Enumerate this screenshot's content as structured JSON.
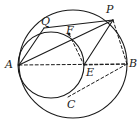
{
  "figure": {
    "stroke_color": "#1a1a1a",
    "background_color": "#ffffff",
    "solid_stroke_width": 1.1,
    "dashed_stroke_width": 1.0,
    "dash_pattern": "3,2.4"
  },
  "circles": [
    {
      "name": "outer-circle",
      "cx": 73,
      "cy": 64,
      "r": 54,
      "style": "solid"
    },
    {
      "name": "inner-circle",
      "cx": 51,
      "cy": 65,
      "r": 33,
      "style": "solid"
    }
  ],
  "points": [
    {
      "id": "A",
      "label": "A",
      "x": 19,
      "y": 65,
      "label_x": 5,
      "label_y": 59
    },
    {
      "id": "B",
      "label": "B",
      "x": 127,
      "y": 64,
      "label_x": 129,
      "label_y": 58
    },
    {
      "id": "C",
      "label": "C",
      "x": 68,
      "y": 97,
      "label_x": 67,
      "label_y": 99
    },
    {
      "id": "E",
      "label": "E",
      "x": 84,
      "y": 65,
      "label_x": 86,
      "label_y": 67
    },
    {
      "id": "F",
      "label": "F",
      "x": 69,
      "y": 34,
      "label_x": 66,
      "label_y": 25
    },
    {
      "id": "P",
      "label": "P",
      "x": 113,
      "y": 20,
      "label_x": 106,
      "label_y": 4
    },
    {
      "id": "Q",
      "label": "Q",
      "x": 44,
      "y": 28,
      "label_x": 41,
      "label_y": 16
    }
  ],
  "segments": [
    {
      "name": "segment-A-B",
      "from": "A",
      "to": "B",
      "style": "dashed"
    },
    {
      "name": "segment-A-P",
      "from": "A",
      "to": "P",
      "style": "solid"
    },
    {
      "name": "segment-Q-P",
      "from": "Q",
      "to": "P",
      "style": "solid"
    },
    {
      "name": "segment-A-Q",
      "from": "A",
      "to": "Q",
      "style": "solid"
    },
    {
      "name": "segment-F-E",
      "from": "F",
      "to": "E",
      "style": "dashed"
    },
    {
      "name": "segment-E-B",
      "from": "E",
      "to": "B",
      "style": "dashed"
    },
    {
      "name": "segment-C-B",
      "from": "C",
      "to": "B",
      "style": "dashed"
    },
    {
      "name": "segment-P-B",
      "from": "P",
      "to": "B",
      "style": "dashed"
    },
    {
      "name": "segment-P-E",
      "from": "P",
      "to": "E",
      "style": "solid"
    }
  ]
}
